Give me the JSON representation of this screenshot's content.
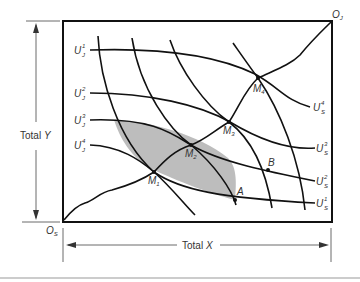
{
  "diagram": {
    "type": "edgeworth-box",
    "origins": {
      "s": {
        "base": "O",
        "sub": "S"
      },
      "j": {
        "base": "O",
        "sub": "J"
      }
    },
    "axes": {
      "y_label": "Total Y",
      "y_label_plain": "Total ",
      "y_label_var": "Y",
      "x_label_plain": "Total ",
      "x_label_var": "X"
    },
    "j_curves": [
      {
        "base": "U",
        "sub": "J",
        "sup": "1"
      },
      {
        "base": "U",
        "sub": "J",
        "sup": "2"
      },
      {
        "base": "U",
        "sub": "J",
        "sup": "3"
      },
      {
        "base": "U",
        "sub": "J",
        "sup": "4"
      }
    ],
    "s_curves": [
      {
        "base": "U",
        "sub": "S",
        "sup": "4"
      },
      {
        "base": "U",
        "sub": "S",
        "sup": "3"
      },
      {
        "base": "U",
        "sub": "S",
        "sup": "2"
      },
      {
        "base": "U",
        "sub": "S",
        "sup": "1"
      }
    ],
    "points": [
      {
        "base": "M",
        "sub": "1"
      },
      {
        "base": "M",
        "sub": "2"
      },
      {
        "base": "M",
        "sub": "3"
      },
      {
        "base": "M",
        "sub": "4"
      },
      {
        "base": "A",
        "sub": ""
      },
      {
        "base": "B",
        "sub": ""
      }
    ],
    "shaded_region": "lens between U_J^3 and U_S^1 through M2 to A",
    "colors": {
      "line": "#111111",
      "shade": "#bdbdbd",
      "text": "#333333"
    }
  }
}
